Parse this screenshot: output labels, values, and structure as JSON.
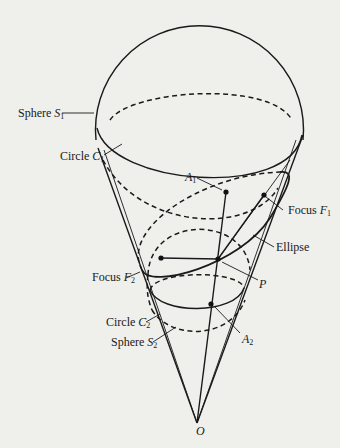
{
  "figure": {
    "labels": {
      "sphere_s1": {
        "text": "Sphere ",
        "var": "S",
        "sub": "1"
      },
      "circle_c1": {
        "text": "Circle ",
        "var": "C",
        "sub": "1"
      },
      "a1": {
        "var": "A",
        "sub": "1"
      },
      "focus_f1": {
        "text": "Focus ",
        "var": "F",
        "sub": "1"
      },
      "ellipse": {
        "text": "Ellipse"
      },
      "focus_f2": {
        "text": "Focus ",
        "var": "F",
        "sub": "2"
      },
      "p": {
        "var": "P"
      },
      "circle_c2": {
        "text": "Circle ",
        "var": "C",
        "sub": "2"
      },
      "sphere_s2": {
        "text": "Sphere ",
        "var": "S",
        "sub": "2"
      },
      "a2": {
        "var": "A",
        "sub": "2"
      },
      "o": {
        "var": "O"
      }
    },
    "colors": {
      "ink": "#1a1a1a",
      "paper": "#efefec"
    }
  }
}
